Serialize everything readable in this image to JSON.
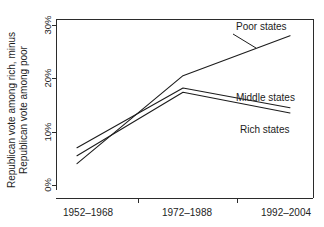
{
  "chart_data": {
    "type": "line",
    "title": "",
    "subtitle": "",
    "xlabel": "",
    "ylabel": "Republican vote among rich, minus Republican vote among poor",
    "ylabel_line1": "Republican vote among rich, minus",
    "ylabel_line2": "Republican vote among poor",
    "categories": [
      "1952–1968",
      "1972–1988",
      "1992–2004"
    ],
    "x_tick_labels": [
      "1952–1968",
      "1972–1988",
      "1992–2004"
    ],
    "y_tick_labels": [
      "0%",
      "10%",
      "20%",
      "30%"
    ],
    "y_tick_values": [
      0,
      10,
      20,
      30
    ],
    "ylim": [
      -2,
      32
    ],
    "yunit": "%",
    "grid": false,
    "legend_position": "inline-right",
    "series": [
      {
        "name": "Poor states",
        "label": "Poor states",
        "values": [
          4.0,
          20.5,
          28.0
        ],
        "color": "#1c1c1c"
      },
      {
        "name": "Middle states",
        "label": "Middle states",
        "values": [
          7.0,
          18.2,
          14.5
        ],
        "color": "#1c1c1c"
      },
      {
        "name": "Rich states",
        "label": "Rich states",
        "values": [
          5.5,
          17.4,
          13.5
        ],
        "color": "#1c1c1c"
      }
    ]
  },
  "annotations": {
    "poor_states": "Poor states",
    "middle_states": "Middle states",
    "rich_states": "Rich states"
  },
  "colors": {
    "line": "#1c1c1c",
    "axis": "#2b2b2b",
    "text": "#232323",
    "background": "#ffffff"
  }
}
